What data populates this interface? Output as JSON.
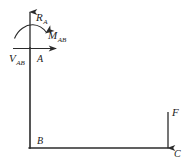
{
  "figure": {
    "type": "free-body-diagram",
    "background_color": "#ffffff",
    "line_color": "#2b2b2b",
    "label_color": "#1a1a1a"
  },
  "structure": {
    "name": "L-shaped bent frame",
    "members": [
      {
        "name": "member-AB",
        "orientation": "vertical",
        "from": "A",
        "to": "B",
        "x": 30,
        "y_top": 48,
        "y_bottom": 148
      },
      {
        "name": "member-BC",
        "orientation": "horizontal",
        "from": "B",
        "to": "C",
        "y": 148,
        "x_left": 30,
        "x_right": 168
      }
    ]
  },
  "nodes": [
    {
      "id": "A",
      "label": "A",
      "x": 30,
      "y": 48,
      "label_x": 37,
      "label_y": 62
    },
    {
      "id": "B",
      "label": "B",
      "x": 30,
      "y": 148,
      "label_x": 37,
      "label_y": 144
    },
    {
      "id": "C",
      "label": "C",
      "x": 168,
      "y": 148,
      "label_x": 174,
      "label_y": 157
    }
  ],
  "loads": [
    {
      "name": "reaction-vertical",
      "symbol": "R",
      "subscript": "A",
      "kind": "force",
      "direction": "up",
      "applied_at": "A",
      "label_x": 36,
      "label_y": 21
    },
    {
      "name": "reaction-horizontal",
      "symbol": "V",
      "subscript": "AB",
      "kind": "force",
      "direction": "right",
      "applied_at": "A",
      "label_x": 9,
      "label_y": 62
    },
    {
      "name": "reaction-moment",
      "symbol": "M",
      "subscript": "AB",
      "kind": "moment",
      "direction": "clockwise",
      "applied_at": "A",
      "label_x": 48,
      "label_y": 39
    },
    {
      "name": "applied-load",
      "symbol": "F",
      "subscript": "",
      "kind": "force",
      "direction": "down",
      "applied_at": "C",
      "label_x": 172,
      "label_y": 116
    }
  ]
}
